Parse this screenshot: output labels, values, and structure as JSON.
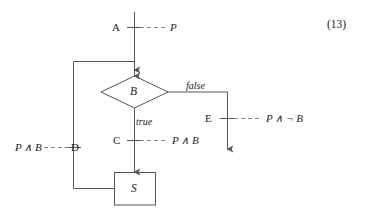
{
  "figure": {
    "type": "flowchart",
    "caption_number": "(13)",
    "background_color": "#ffffff",
    "line_color": "#555555",
    "text_color": "#222222",
    "nodes": {
      "decision": {
        "label": "B",
        "shape": "diamond"
      },
      "statement": {
        "label": "S",
        "shape": "rectangle"
      }
    },
    "control_points": [
      {
        "id": "A",
        "label": "A",
        "assertion": "P"
      },
      {
        "id": "C",
        "label": "C",
        "assertion": "P ∧ B"
      },
      {
        "id": "D",
        "label": "D",
        "assertion": "P ∧ B"
      },
      {
        "id": "E",
        "label": "E",
        "assertion": "P ∧ ¬ B"
      }
    ],
    "branch_labels": {
      "true_branch": "true",
      "false_branch": "false"
    }
  }
}
